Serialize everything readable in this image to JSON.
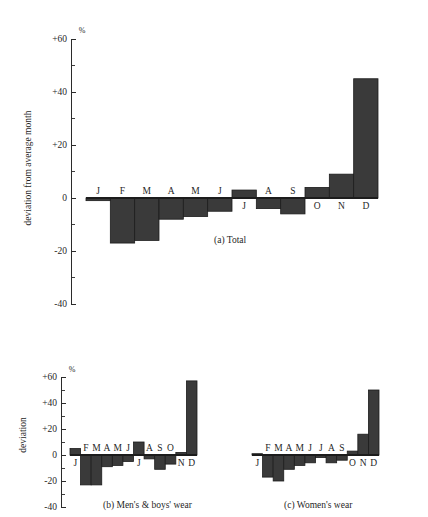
{
  "figure": {
    "background_color": "#ffffff",
    "bar_color": "#3a3a3a",
    "axis_color": "#2b2b2b",
    "percent_symbol": "%"
  },
  "chart_data": [
    {
      "type": "bar",
      "id": "panel-a",
      "title": "(a)  Total",
      "caption_index": "(a)",
      "caption_text": "Total",
      "xlabel": "",
      "ylabel": "deviation from average month",
      "ylim": [
        -40,
        60
      ],
      "ytick_labels": [
        "+60",
        "+40",
        "+20",
        "0",
        "-20",
        "-40"
      ],
      "ytick_values": [
        60,
        40,
        20,
        0,
        -20,
        -40
      ],
      "minor_tick_values": [
        50,
        30,
        10,
        -10,
        -30
      ],
      "grid": false,
      "legend": "none",
      "categories": [
        "J",
        "F",
        "M",
        "A",
        "M",
        "J",
        "J",
        "A",
        "S",
        "O",
        "N",
        "D"
      ],
      "category_names": [
        "January",
        "February",
        "March",
        "April",
        "May",
        "June",
        "July",
        "August",
        "September",
        "October",
        "November",
        "December"
      ],
      "values": [
        -1,
        -17,
        -16,
        -8,
        -7,
        -5,
        3,
        -4,
        -6,
        4,
        9,
        45
      ]
    },
    {
      "type": "bar",
      "id": "panel-b",
      "title": "(b)  Men's & boys' wear",
      "caption_index": "(b)",
      "caption_text": "Men's & boys' wear",
      "xlabel": "",
      "ylabel": "deviation",
      "ylim": [
        -40,
        60
      ],
      "ytick_labels": [
        "+60",
        "+40",
        "+20",
        "0",
        "-20",
        "-40"
      ],
      "ytick_values": [
        60,
        40,
        20,
        0,
        -20,
        -40
      ],
      "minor_tick_values": [
        50,
        30,
        10,
        -10,
        -30
      ],
      "grid": false,
      "legend": "none",
      "categories": [
        "J",
        "F",
        "M",
        "A",
        "M",
        "J",
        "J",
        "A",
        "S",
        "O",
        "N",
        "D"
      ],
      "category_names": [
        "January",
        "February",
        "March",
        "April",
        "May",
        "June",
        "July",
        "August",
        "September",
        "October",
        "November",
        "December"
      ],
      "values": [
        5,
        -23,
        -23,
        -9,
        -8,
        -5,
        10,
        -3,
        -11,
        -7,
        2,
        57
      ]
    },
    {
      "type": "bar",
      "id": "panel-c",
      "title": "(c)  Women's wear",
      "caption_index": "(c)",
      "caption_text": "Women's wear",
      "xlabel": "",
      "ylabel": "",
      "ylim": [
        -40,
        60
      ],
      "ytick_labels": [],
      "ytick_values": [],
      "minor_tick_values": [],
      "grid": false,
      "legend": "none",
      "categories": [
        "J",
        "F",
        "M",
        "A",
        "M",
        "J",
        "J",
        "A",
        "S",
        "O",
        "N",
        "D"
      ],
      "category_names": [
        "January",
        "February",
        "March",
        "April",
        "May",
        "June",
        "July",
        "August",
        "September",
        "October",
        "November",
        "December"
      ],
      "values": [
        1,
        -17,
        -20,
        -11,
        -8,
        -6,
        -2,
        -6,
        -4,
        3,
        16,
        50
      ]
    }
  ],
  "panel_a": {
    "axis_title": "deviation from average month",
    "percent": "%",
    "caption": "(a)   Total",
    "ytick_labels": [
      "+60",
      "+40",
      "+20",
      "0",
      "-20",
      "-40"
    ],
    "month_labels": [
      "J",
      "F",
      "M",
      "A",
      "M",
      "J",
      "J",
      "A",
      "S",
      "O",
      "N",
      "D"
    ]
  },
  "panel_b": {
    "axis_title": "deviation",
    "percent": "%",
    "caption": "(b)   Men's & boys' wear",
    "ytick_labels": [
      "+60",
      "+40",
      "+20",
      "0",
      "-20",
      "-40"
    ],
    "month_labels": [
      "J",
      "F",
      "M",
      "A",
      "M",
      "J",
      "J",
      "A",
      "S",
      "O",
      "N",
      "D"
    ]
  },
  "panel_c": {
    "axis_title": "",
    "percent": "",
    "caption": "(c)   Women's wear",
    "ytick_labels": [],
    "month_labels": [
      "J",
      "F",
      "M",
      "A",
      "M",
      "J",
      "J",
      "A",
      "S",
      "O",
      "N",
      "D"
    ]
  }
}
